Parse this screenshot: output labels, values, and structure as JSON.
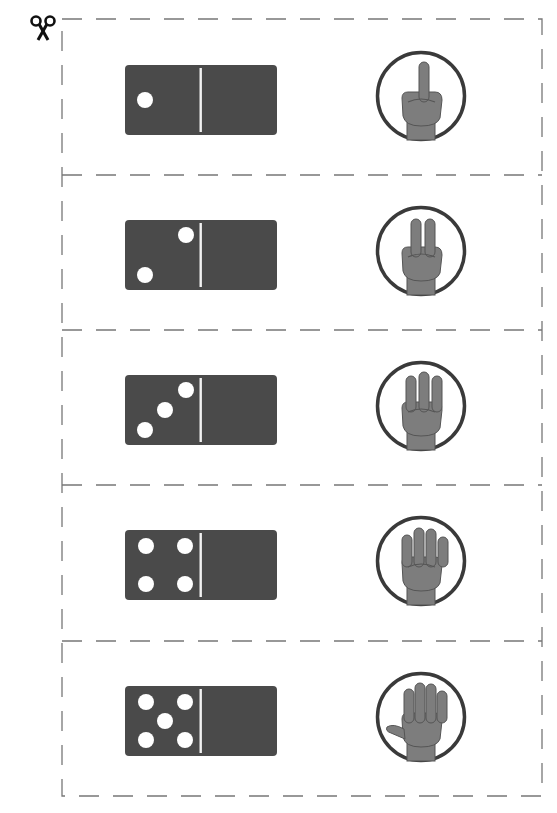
{
  "worksheet": {
    "cut_icon": "scissors-icon",
    "colors": {
      "domino": "#4a4a4a",
      "pip": "#ffffff",
      "divider": "#f2f2f2",
      "circle_stroke": "#3a3a3a",
      "hand": "#7d7d7d",
      "dash": "#777777"
    },
    "cards": [
      {
        "count": 1,
        "domino_icon": "domino-1-icon",
        "hand_icon": "one-finger-hand-icon"
      },
      {
        "count": 2,
        "domino_icon": "domino-2-icon",
        "hand_icon": "two-fingers-hand-icon"
      },
      {
        "count": 3,
        "domino_icon": "domino-3-icon",
        "hand_icon": "three-fingers-hand-icon"
      },
      {
        "count": 4,
        "domino_icon": "domino-4-icon",
        "hand_icon": "four-fingers-hand-icon"
      },
      {
        "count": 5,
        "domino_icon": "domino-5-icon",
        "hand_icon": "five-fingers-hand-icon"
      }
    ]
  }
}
